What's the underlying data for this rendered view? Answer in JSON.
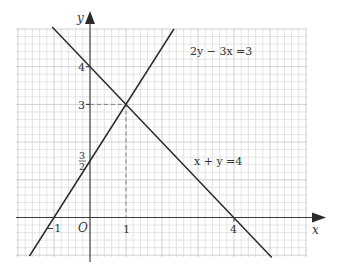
{
  "chart_data": {
    "type": "line",
    "title": "",
    "xlabel": "x",
    "ylabel": "y",
    "origin_label": "O",
    "xlim": [
      -2.05,
      6.0
    ],
    "ylim": [
      -1.0,
      5.0
    ],
    "grid": true,
    "grid_subdivisions_per_unit": 5,
    "x_tick_labels": [
      "-1",
      "1",
      "4"
    ],
    "x_ticks": [
      -1,
      1,
      4
    ],
    "y_tick_labels": [
      "3/2",
      "3",
      "4"
    ],
    "y_ticks": [
      1.5,
      3,
      4
    ],
    "series": [
      {
        "name": "x + y = 4",
        "equation": "x + y = 4",
        "label": "x + y =4",
        "points": [
          [
            -1.05,
            5.05
          ],
          [
            5.05,
            -1.05
          ]
        ],
        "intercepts": {
          "x": 4,
          "y": 4
        }
      },
      {
        "name": "2y - 3x = 3",
        "equation": "2y - 3x = 3",
        "label": "2y − 3x =3",
        "points": [
          [
            -1.68,
            -1.02
          ],
          [
            2.33,
            5.0
          ]
        ],
        "intercepts": {
          "x": -1,
          "y": 1.5
        }
      }
    ],
    "annotations": [
      {
        "type": "intersection",
        "x": 1,
        "y": 3,
        "guides": "dashed lines to both axes"
      }
    ]
  },
  "labels": {
    "y_axis": "y",
    "x_axis": "x",
    "origin": "O",
    "x_tick_neg1": "−1",
    "x_tick_1": "1",
    "x_tick_4": "4",
    "y_tick_4": "4",
    "y_tick_3": "3",
    "y_tick_frac_num": "3",
    "y_tick_frac_den": "2",
    "line1_label": "2y − 3x =3",
    "line2_label": "x + y =4"
  }
}
